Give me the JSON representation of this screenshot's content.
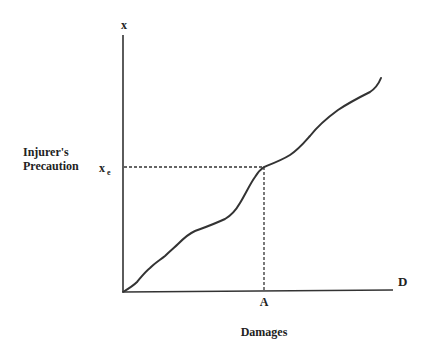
{
  "diagram": {
    "type": "line",
    "y_axis": {
      "symbol": "x",
      "label_line1": "Injurer's",
      "label_line2": "Precaution"
    },
    "x_axis": {
      "symbol": "D",
      "label": "Damages"
    },
    "markers": {
      "x_value_label_base": "x",
      "x_value_label_sub": "e",
      "d_value_label": "A"
    },
    "curve_description": "Upward-sloping wavy curve showing injurer's precaution x increasing with damages D; at damages A, precaution equals x_e",
    "colors": {
      "ink": "#333333",
      "background": "#ffffff"
    }
  }
}
